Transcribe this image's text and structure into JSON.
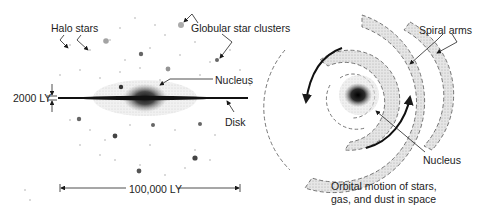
{
  "side_view": {
    "labels": {
      "halo_stars": "Halo stars",
      "globular_clusters": "Globular star clusters",
      "nucleus": "Nucleus",
      "disk": "Disk",
      "thickness": "2000 LY",
      "diameter": "100,000 LY"
    }
  },
  "top_view": {
    "labels": {
      "spiral_arms": "Spiral arms",
      "nucleus": "Nucleus",
      "orbital_line1": "Orbital motion of stars,",
      "orbital_line2": "gas, and  dust in space"
    }
  },
  "colors": {
    "ink": "#1a1a1a",
    "arm_fill": "#d9d9d9",
    "text": "#222222"
  }
}
